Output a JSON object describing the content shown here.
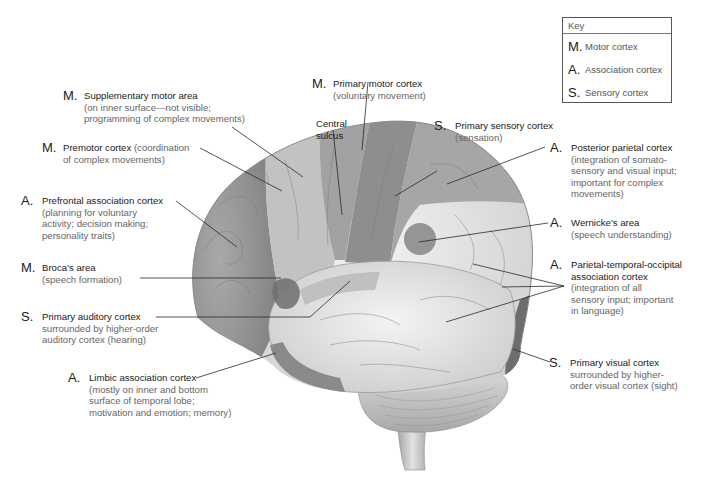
{
  "key": {
    "title": "Key",
    "items": [
      {
        "code": "M.",
        "label": "Motor cortex"
      },
      {
        "code": "A.",
        "label": "Association cortex"
      },
      {
        "code": "S.",
        "label": "Sensory cortex"
      }
    ]
  },
  "labels": {
    "supplementary_motor": {
      "code": "M.",
      "title": "Supplementary motor area",
      "desc": [
        "(on inner surface—not visible;",
        "programming of complex movements)"
      ]
    },
    "premotor": {
      "code": "M.",
      "title": "Premotor cortex",
      "inline_desc": " (coordination",
      "desc": [
        "of complex movements)"
      ]
    },
    "prefrontal": {
      "code": "A.",
      "title": "Prefrontal association cortex",
      "desc": [
        "(planning for voluntary",
        "activity; decision making;",
        "personality traits)"
      ]
    },
    "broca": {
      "code": "M.",
      "title": "Broca’s area",
      "desc": [
        "(speech formation)"
      ]
    },
    "primary_auditory": {
      "code": "S.",
      "title": "Primary auditory cortex",
      "desc": [
        "surrounded by higher-order",
        "auditory cortex (hearing)"
      ]
    },
    "limbic": {
      "code": "A.",
      "title": "Limbic association cortex",
      "desc": [
        "(mostly on inner and bottom",
        "surface of temporal lobe;",
        "motivation and emotion; memory)"
      ]
    },
    "primary_motor": {
      "code": "M.",
      "title": "Primary motor cortex",
      "desc": [
        "(voluntary movement)"
      ]
    },
    "central_sulcus": {
      "title_lines": [
        "Central",
        "sulcus"
      ]
    },
    "primary_sensory": {
      "code": "S.",
      "title": "Primary sensory cortex",
      "desc": [
        "(sensation)"
      ]
    },
    "posterior_parietal": {
      "code": "A.",
      "title": "Posterior parietal cortex",
      "desc": [
        "(integration of somato-",
        "sensory and visual input;",
        "important for complex",
        "movements)"
      ]
    },
    "wernicke": {
      "code": "A.",
      "title": "Wernicke’s area",
      "desc": [
        "(speech understanding)"
      ]
    },
    "pto": {
      "code": "A.",
      "title_lines": [
        "Parietal-temporal-occipital",
        "association cortex"
      ],
      "desc": [
        "(integration of all",
        "sensory input; important",
        "in language)"
      ]
    },
    "primary_visual": {
      "code": "S.",
      "title": "Primary visual cortex",
      "desc": [
        "surrounded by higher-",
        "order visual cortex (sight)"
      ]
    }
  }
}
